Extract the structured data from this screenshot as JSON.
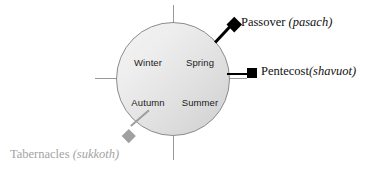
{
  "diagram": {
    "circle": {
      "quadrants": [
        {
          "name": "Winter",
          "position": "upper-left"
        },
        {
          "name": "Spring",
          "position": "upper-right"
        },
        {
          "name": "Autumn",
          "position": "lower-left"
        },
        {
          "name": "Summer",
          "position": "lower-right"
        }
      ]
    },
    "annotations": [
      {
        "id": "passover",
        "name": "Passover",
        "term": "(pasach)",
        "marker": "diamond-marker",
        "color": "#000000",
        "anchor": "upper-right"
      },
      {
        "id": "pentecost",
        "name": "Pentecost",
        "term": "(shavuot)",
        "marker": "square-marker",
        "color": "#000000",
        "anchor": "right"
      },
      {
        "id": "tabernacles",
        "name": "Tabernacles ",
        "term": "(sukkoth)",
        "marker": "diamond-marker",
        "color": "#a3a3a3",
        "anchor": "lower-left"
      }
    ]
  }
}
